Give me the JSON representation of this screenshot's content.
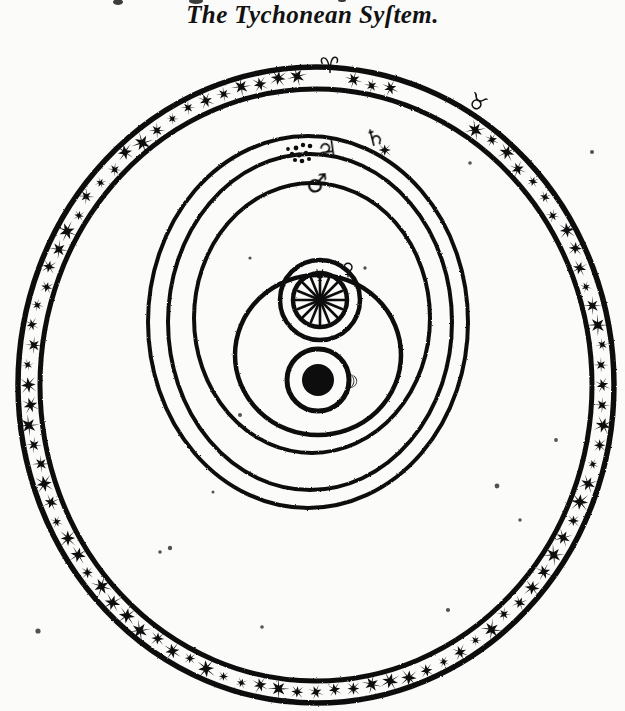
{
  "page": {
    "title": "The Tychonean Syſtem.",
    "title_plain": "The Tychonean System.",
    "background_color": "#fbfbf9",
    "ink_color": "#111111",
    "width": 625,
    "height": 711
  },
  "chart_data": {
    "type": "diagram",
    "subtype": "geo-heliocentric cosmological model",
    "title": "The Tychonean Syſtem.",
    "center_body": "Earth",
    "bodies": [
      {
        "name": "Earth",
        "symbol": "⊕",
        "glyph": "earth-disk",
        "role": "centre of the universe",
        "cx": 318,
        "cy": 380,
        "radius": 16,
        "filled": true
      },
      {
        "name": "Moon",
        "symbol": "☽",
        "glyph": "moon-crescent",
        "role": "orbits the Earth",
        "orbit_cx": 318,
        "orbit_cy": 380,
        "orbit_r": 31,
        "marker_angle_deg": 8
      },
      {
        "name": "Sun",
        "symbol": "☉",
        "glyph": "sun-rayed",
        "role": "orbits the Earth; centre of planetary orbits",
        "cx": 320,
        "cy": 300,
        "radius": 17,
        "orbit_cx": 318,
        "orbit_cy": 355,
        "orbit_r": 83
      },
      {
        "name": "Mercury",
        "symbol": "☿",
        "glyph": "mercury-marker",
        "role": "orbits the Sun",
        "orbit_cx": 320,
        "orbit_cy": 300,
        "orbit_r": 27,
        "marker_angle_deg": -70
      },
      {
        "name": "Venus",
        "symbol": "♀",
        "glyph": "venus-marker",
        "role": "orbits the Sun",
        "orbit_cx": 320,
        "orbit_cy": 300,
        "orbit_r": 40,
        "marker_angle_deg": -48
      },
      {
        "name": "Mars",
        "symbol": "♂",
        "glyph": "mars-arrow",
        "role": "orbits the Sun",
        "orbit_cx": 312,
        "orbit_cy": 318,
        "orbit_rx": 118,
        "orbit_ry": 135,
        "marker_angle_deg": -86
      },
      {
        "name": "Jupiter",
        "symbol": "♃",
        "glyph": "jupiter-glyph",
        "role": "orbits the Sun",
        "orbit_cx": 310,
        "orbit_cy": 322,
        "orbit_rx": 142,
        "orbit_ry": 168,
        "marker_angle_deg": -84
      },
      {
        "name": "Saturn",
        "symbol": "♄",
        "glyph": "saturn-glyph",
        "role": "orbits the Sun",
        "orbit_cx": 308,
        "orbit_cy": 322,
        "orbit_rx": 160,
        "orbit_ry": 186,
        "marker_angle_deg": -74
      }
    ],
    "firmament": {
      "label": "sphere of the fixed stars / zodiac band",
      "cx": 316,
      "cy": 385,
      "outer_rx": 298,
      "outer_ry": 318,
      "band_thickness": 22,
      "star_count": 96,
      "zodiac_signs_visible": [
        {
          "name": "Aries",
          "symbol": "♈",
          "angle_deg": -94
        },
        {
          "name": "Taurus",
          "symbol": "♉",
          "angle_deg": -66
        }
      ]
    },
    "orbit_rings": [
      {
        "body": "Saturn",
        "order": 1
      },
      {
        "body": "Jupiter",
        "order": 2
      },
      {
        "body": "Mars",
        "order": 3
      },
      {
        "body": "Sun",
        "order": 4
      },
      {
        "body": "Venus",
        "order": 5
      },
      {
        "body": "Mercury",
        "order": 6
      },
      {
        "body": "Moon",
        "order": 7
      }
    ]
  },
  "labels": {
    "saturn": "♄",
    "jupiter": "♃",
    "mars": "♂",
    "venus": "♀",
    "mercury": "☿",
    "moon": "☽",
    "sun": "☉",
    "aries": "♈",
    "taurus": "♉"
  }
}
